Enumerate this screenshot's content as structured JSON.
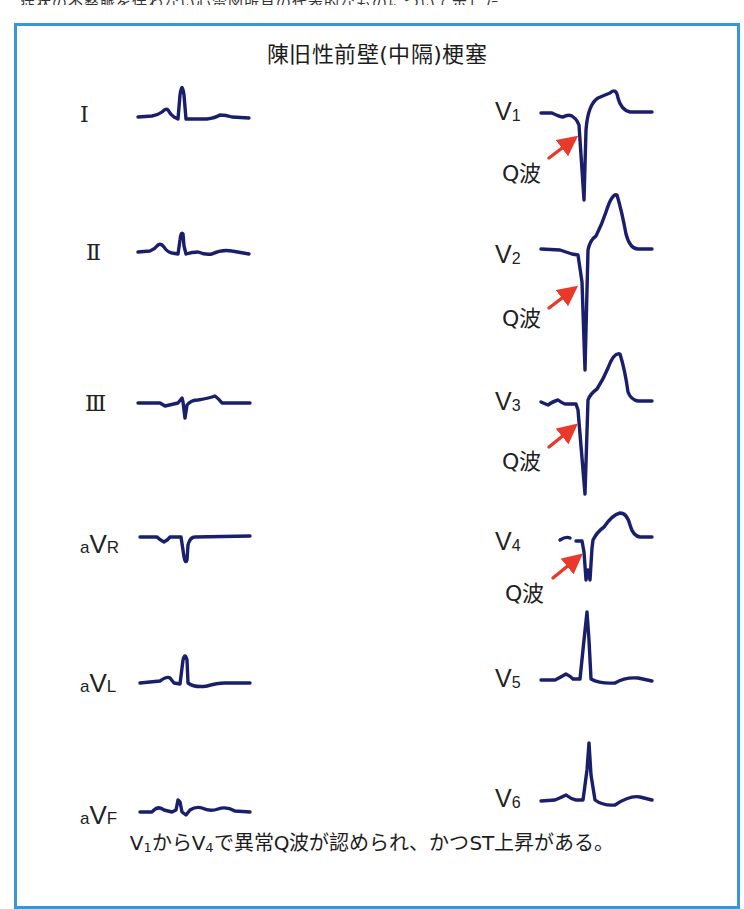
{
  "top_strip": {
    "text": "症状の不整脈を伴わない心電図所見の代表的なものについて示した"
  },
  "figure": {
    "title": "陳旧性前壁(中隔)梗塞",
    "border_color": "#3a96d8",
    "trace_color": "#1a1f6b",
    "arrow_color": "#e8392b",
    "limb_leads": [
      {
        "id": "I",
        "label": "Ⅰ"
      },
      {
        "id": "II",
        "label": "Ⅱ"
      },
      {
        "id": "III",
        "label": "Ⅲ"
      },
      {
        "id": "aVR",
        "prefix": "a",
        "main": "V",
        "suffix": "R"
      },
      {
        "id": "aVL",
        "prefix": "a",
        "main": "V",
        "suffix": "L"
      },
      {
        "id": "aVF",
        "prefix": "a",
        "main": "V",
        "suffix": "F"
      }
    ],
    "chest_leads": [
      {
        "id": "V1",
        "main": "V",
        "sub": "1",
        "q_wave": true
      },
      {
        "id": "V2",
        "main": "V",
        "sub": "2",
        "q_wave": true
      },
      {
        "id": "V3",
        "main": "V",
        "sub": "3",
        "q_wave": true
      },
      {
        "id": "V4",
        "main": "V",
        "sub": "4",
        "q_wave": true
      },
      {
        "id": "V5",
        "main": "V",
        "sub": "5",
        "q_wave": false
      },
      {
        "id": "V6",
        "main": "V",
        "sub": "6",
        "q_wave": false
      }
    ],
    "q_wave_label": "Q波",
    "footer": {
      "part1": "V",
      "sub1": "1",
      "part2": "から",
      "part3": "V",
      "sub2": "4",
      "part4": "で異常Q波が認められ、かつST上昇がある。"
    }
  }
}
